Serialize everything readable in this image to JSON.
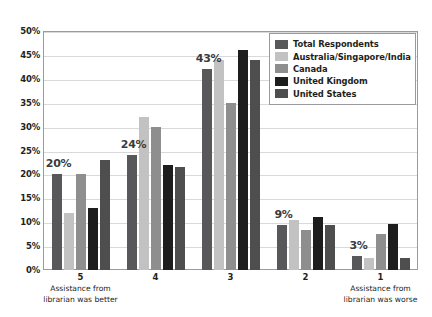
{
  "chart_data": {
    "type": "bar",
    "title": "",
    "subtitle": "",
    "xlabel": "",
    "ylabel": "",
    "ylim": [
      0,
      50
    ],
    "ytick_labels": [
      "50%",
      "45%",
      "40%",
      "35%",
      "30%",
      "25%",
      "20%",
      "15%",
      "10%",
      "5%",
      "0%"
    ],
    "ytick_values": [
      50,
      45,
      40,
      35,
      30,
      25,
      20,
      15,
      10,
      5,
      0
    ],
    "grid": true,
    "legend_position": "top-right",
    "categories": [
      "5",
      "4",
      "3",
      "2",
      "1"
    ],
    "category_captions": [
      "Assistance from\nlibrarian was better",
      "",
      "",
      "",
      "Assistance from\nlibrarian was worse"
    ],
    "series": [
      {
        "name": "Total Respondents",
        "color": "#58585a",
        "values": [
          20,
          24,
          42,
          9.5,
          3
        ]
      },
      {
        "name": "Australia/Singapore/India",
        "color": "#c2c2c2",
        "values": [
          12,
          32,
          44,
          10.4,
          2.5
        ]
      },
      {
        "name": "Canada",
        "color": "#8e8e8e",
        "values": [
          20,
          30,
          35,
          8.4,
          7.5
        ]
      },
      {
        "name": "United Kingdom",
        "color": "#1d1d1d",
        "values": [
          13,
          22,
          46,
          11,
          9.7
        ]
      },
      {
        "name": "United States",
        "color": "#4e4e4e",
        "values": [
          23,
          21.5,
          44,
          9.4,
          2.6
        ]
      }
    ],
    "data_labels": [
      {
        "category": "5",
        "text": "20%"
      },
      {
        "category": "4",
        "text": "24%"
      },
      {
        "category": "3",
        "text": "43%"
      },
      {
        "category": "2",
        "text": "9%"
      },
      {
        "category": "1",
        "text": "3%"
      }
    ]
  },
  "axis": {
    "x_caption_left_line1": "Assistance from",
    "x_caption_left_line2": "librarian was better",
    "x_caption_right_line1": "Assistance from",
    "x_caption_right_line2": "librarian was worse"
  },
  "colors": {
    "plot_background": "#ffffff",
    "frame_border": "#9b9b9b",
    "gridline": "#d9d9d9",
    "text": "#231f20",
    "label_text": "#3b3b3b"
  }
}
